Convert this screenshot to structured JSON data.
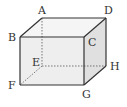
{
  "diagram": {
    "type": "rectangular-prism",
    "colors": {
      "edge": "#333333",
      "hidden_edge": "#555555",
      "front_face": "#eeeeee",
      "right_face": "#e0e0e0",
      "top_face": "#f5f5f5"
    },
    "vertices": {
      "A": {
        "x": 42,
        "y": 18
      },
      "B": {
        "x": 20,
        "y": 37
      },
      "C": {
        "x": 84,
        "y": 37
      },
      "D": {
        "x": 106,
        "y": 18
      },
      "E": {
        "x": 42,
        "y": 66
      },
      "F": {
        "x": 20,
        "y": 85
      },
      "G": {
        "x": 84,
        "y": 85
      },
      "H": {
        "x": 106,
        "y": 66
      }
    },
    "labels": {
      "A": "A",
      "B": "B",
      "C": "C",
      "D": "D",
      "E": "E",
      "F": "F",
      "G": "G",
      "H": "H"
    },
    "visible_edges": [
      "AB",
      "AD",
      "BC",
      "CD",
      "BF",
      "FG",
      "CG",
      "DH",
      "GH"
    ],
    "hidden_edges": [
      "AE",
      "EF",
      "EH"
    ]
  }
}
